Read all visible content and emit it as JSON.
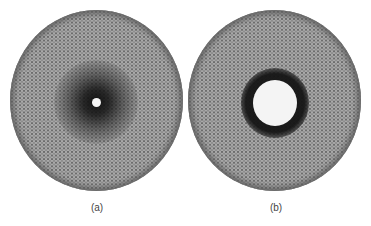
{
  "figure": {
    "panels": [
      {
        "label": "(a)",
        "description": "circular diffraction-like pattern with dark central halo and small bright center spot",
        "colors": {
          "background": "#a9a9a9",
          "center_halo": "#141414",
          "center_spot": "#f4f4f4"
        }
      },
      {
        "label": "(b)",
        "description": "circular pattern with large bright central hole surrounded by dark ring",
        "colors": {
          "background": "#a9a9a9",
          "ring": "#1e1e1e",
          "hole": "#f4f4f4"
        }
      }
    ]
  }
}
